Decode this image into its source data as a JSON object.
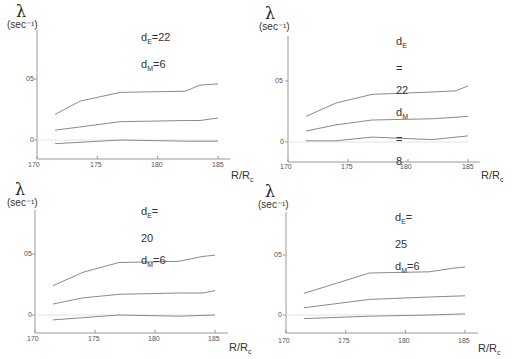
{
  "y_axis_symbol": "λ",
  "y_axis_unit": "(sec⁻¹)",
  "x_axis_label": "R/R",
  "x_axis_label_sub": "c",
  "x_ticks": [
    "170",
    "175",
    "180",
    "185"
  ],
  "y_ticks": [
    "0",
    "05"
  ],
  "chart_data": [
    {
      "type": "line",
      "title": "d_E=22, d_M=6",
      "params": {
        "dE": "22",
        "dM": "6"
      },
      "xlabel": "R/R_c",
      "ylabel": "λ (sec^-1)",
      "xlim": [
        170,
        186
      ],
      "ylim": [
        -0.1,
        1.0
      ],
      "x_ticks": [
        170,
        175,
        180,
        185
      ],
      "y_ticks": [
        0,
        0.5
      ],
      "grid": false,
      "series": [
        {
          "name": "upper",
          "x": [
            171.5,
            173.6,
            176.9,
            182.3,
            183.5,
            185
          ],
          "values": [
            0.21,
            0.32,
            0.39,
            0.4,
            0.45,
            0.46
          ]
        },
        {
          "name": "middle",
          "x": [
            171.5,
            176.9,
            182.3,
            183.5,
            185
          ],
          "values": [
            0.08,
            0.15,
            0.16,
            0.16,
            0.18
          ]
        },
        {
          "name": "lower",
          "x": [
            171.5,
            176.9,
            182.3,
            185
          ],
          "values": [
            -0.03,
            0.0,
            -0.01,
            -0.01
          ]
        }
      ]
    },
    {
      "type": "line",
      "title": "d_E=22, d_M=8",
      "params": {
        "dE": "22",
        "dM": "8"
      },
      "xlabel": "R/R_c",
      "ylabel": "λ (sec^-1)",
      "xlim": [
        170,
        186
      ],
      "ylim": [
        -0.1,
        1.0
      ],
      "x_ticks": [
        170,
        175,
        180,
        185
      ],
      "y_ticks": [
        0,
        0.5
      ],
      "grid": false,
      "series": [
        {
          "name": "upper",
          "x": [
            171.5,
            174,
            177,
            182,
            184,
            185
          ],
          "values": [
            0.21,
            0.32,
            0.39,
            0.41,
            0.42,
            0.46
          ]
        },
        {
          "name": "middle",
          "x": [
            171.5,
            174,
            177,
            182,
            185
          ],
          "values": [
            0.09,
            0.14,
            0.18,
            0.19,
            0.21
          ]
        },
        {
          "name": "lower",
          "x": [
            171.5,
            174,
            177,
            182,
            185
          ],
          "values": [
            0.01,
            0.01,
            0.04,
            0.02,
            0.05
          ]
        }
      ]
    },
    {
      "type": "line",
      "title": "d_E=20, d_M=6",
      "params": {
        "dE": "20",
        "dM": "6"
      },
      "xlabel": "R/R_c",
      "ylabel": "λ (sec^-1)",
      "xlim": [
        170,
        186
      ],
      "ylim": [
        -0.1,
        1.0
      ],
      "x_ticks": [
        170,
        175,
        180,
        185
      ],
      "y_ticks": [
        0,
        0.5
      ],
      "grid": false,
      "series": [
        {
          "name": "upper",
          "x": [
            171.5,
            174,
            177,
            182,
            184,
            185
          ],
          "values": [
            0.24,
            0.35,
            0.43,
            0.44,
            0.48,
            0.49
          ]
        },
        {
          "name": "middle",
          "x": [
            171.5,
            174,
            177,
            182,
            184,
            185
          ],
          "values": [
            0.09,
            0.14,
            0.17,
            0.18,
            0.18,
            0.2
          ]
        },
        {
          "name": "lower",
          "x": [
            171.5,
            177,
            182,
            185
          ],
          "values": [
            -0.04,
            0.0,
            -0.01,
            0.0
          ]
        }
      ]
    },
    {
      "type": "line",
      "title": "d_E=25, d_M=6",
      "params": {
        "dE": "25",
        "dM": "6"
      },
      "xlabel": "R/R_c",
      "ylabel": "λ (sec^-1)",
      "xlim": [
        170,
        186
      ],
      "ylim": [
        -0.1,
        1.0
      ],
      "x_ticks": [
        170,
        175,
        180,
        185
      ],
      "y_ticks": [
        0,
        0.5
      ],
      "grid": false,
      "series": [
        {
          "name": "upper",
          "x": [
            171.5,
            177,
            182,
            184,
            185
          ],
          "values": [
            0.18,
            0.35,
            0.36,
            0.39,
            0.4
          ]
        },
        {
          "name": "middle",
          "x": [
            171.5,
            177,
            182,
            185
          ],
          "values": [
            0.06,
            0.13,
            0.15,
            0.16
          ]
        },
        {
          "name": "lower",
          "x": [
            171.5,
            177,
            182,
            185
          ],
          "values": [
            -0.03,
            -0.01,
            0.0,
            0.01
          ]
        }
      ]
    }
  ],
  "panels": [
    {
      "dE": "22",
      "dM": "6"
    },
    {
      "dE": "22",
      "dM": "8"
    },
    {
      "dE": "20",
      "dM": "6"
    },
    {
      "dE": "25",
      "dM": "6"
    }
  ]
}
